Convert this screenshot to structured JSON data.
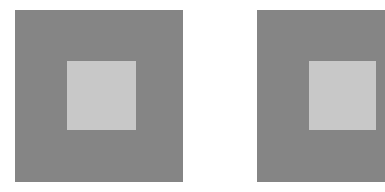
{
  "figure": {
    "type": "simultaneous-contrast-illusion",
    "background_color": "#ffffff",
    "panels": [
      {
        "name": "left",
        "outer": {
          "x": 15,
          "y": 10,
          "w": 168,
          "h": 172,
          "color": "#858585"
        },
        "inner": {
          "x": 67,
          "y": 61,
          "w": 69,
          "h": 69,
          "color": "#c8c8c8"
        }
      },
      {
        "name": "right",
        "outer": {
          "x": 257,
          "y": 10,
          "w": 128,
          "h": 172,
          "color": "#858585"
        },
        "inner": {
          "x": 309,
          "y": 61,
          "w": 67,
          "h": 69,
          "color": "#c8c8c8"
        }
      }
    ]
  }
}
